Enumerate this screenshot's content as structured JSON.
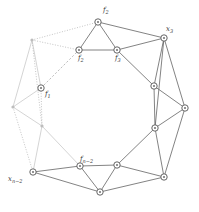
{
  "figure": {
    "width": 199,
    "height": 212,
    "background_color": "#ffffff",
    "edge_color": "#5a5a5a",
    "faint_edge_color": "#c2c2c2",
    "node_fill": "#ffffff",
    "node_stroke": "#555555"
  },
  "labels": [
    {
      "id": "label-f2",
      "text": "f",
      "sub": "2",
      "x": 103,
      "y": 7,
      "faint": false
    },
    {
      "id": "label-x3",
      "text": "x",
      "sub": "3",
      "x": 166,
      "y": 26,
      "faint": false
    },
    {
      "id": "label-f2b",
      "text": "f",
      "sub": "2",
      "x": 78,
      "y": 55,
      "faint": false
    },
    {
      "id": "label-f3",
      "text": "f",
      "sub": "3",
      "x": 115,
      "y": 55,
      "faint": false
    },
    {
      "id": "label-f1",
      "text": "f",
      "sub": "1",
      "x": 45,
      "y": 91,
      "faint": false
    },
    {
      "id": "label-fn2",
      "text": "f",
      "sub": "n−2",
      "x": 80,
      "y": 156,
      "faint": false
    },
    {
      "id": "label-xn2",
      "text": "x",
      "sub": "n−2",
      "x": 8,
      "y": 176,
      "faint": false
    }
  ],
  "nodes": [
    {
      "id": "n-top",
      "name": "vertex-f2-top",
      "x": 98,
      "y": 22,
      "style": "circle",
      "faint": false
    },
    {
      "id": "n-topright",
      "name": "vertex-x3",
      "x": 164,
      "y": 38,
      "style": "circle",
      "faint": false
    },
    {
      "id": "n-f2",
      "name": "vertex-f2",
      "x": 79,
      "y": 50,
      "style": "circle",
      "faint": false
    },
    {
      "id": "n-f3",
      "name": "vertex-f3",
      "x": 117,
      "y": 50,
      "style": "circle",
      "faint": false
    },
    {
      "id": "n-upleft",
      "name": "vertex-upper-left",
      "x": 32,
      "y": 40,
      "style": "dot",
      "faint": true
    },
    {
      "id": "n-f1",
      "name": "vertex-f1",
      "x": 41,
      "y": 88,
      "style": "circle",
      "faint": false
    },
    {
      "id": "n-left",
      "name": "vertex-left",
      "x": 13,
      "y": 107,
      "style": "dot",
      "faint": true
    },
    {
      "id": "n-lowleft",
      "name": "vertex-lower-left",
      "x": 42,
      "y": 126,
      "style": "dot",
      "faint": true
    },
    {
      "id": "n-xn2",
      "name": "vertex-xn-2",
      "x": 33,
      "y": 172,
      "style": "circle",
      "faint": false
    },
    {
      "id": "n-fn2",
      "name": "vertex-fn-2",
      "x": 80,
      "y": 166,
      "style": "circle",
      "faint": false
    },
    {
      "id": "n-bottom",
      "name": "vertex-bottom",
      "x": 100,
      "y": 192,
      "style": "circle",
      "faint": false
    },
    {
      "id": "n-botmid",
      "name": "vertex-bottom-mid",
      "x": 117,
      "y": 165,
      "style": "circle",
      "faint": false
    },
    {
      "id": "n-botright",
      "name": "vertex-bottom-right",
      "x": 164,
      "y": 177,
      "style": "circle",
      "faint": false
    },
    {
      "id": "n-rlow",
      "name": "vertex-right-lower",
      "x": 155,
      "y": 128,
      "style": "circle",
      "faint": false
    },
    {
      "id": "n-right",
      "name": "vertex-right",
      "x": 185,
      "y": 108,
      "style": "circle",
      "faint": false
    },
    {
      "id": "n-rup",
      "name": "vertex-right-upper",
      "x": 154,
      "y": 86,
      "style": "circle",
      "faint": false
    }
  ],
  "edges": [
    {
      "from": "n-top",
      "to": "n-f2",
      "style": "solid"
    },
    {
      "from": "n-top",
      "to": "n-f3",
      "style": "solid"
    },
    {
      "from": "n-top",
      "to": "n-topright",
      "style": "solid"
    },
    {
      "from": "n-f2",
      "to": "n-f3",
      "style": "solid"
    },
    {
      "from": "n-f3",
      "to": "n-topright",
      "style": "solid"
    },
    {
      "from": "n-f3",
      "to": "n-rup",
      "style": "solid"
    },
    {
      "from": "n-topright",
      "to": "n-rup",
      "style": "solid"
    },
    {
      "from": "n-topright",
      "to": "n-right",
      "style": "solid"
    },
    {
      "from": "n-topright",
      "to": "n-rlow",
      "style": "solid"
    },
    {
      "from": "n-rup",
      "to": "n-right",
      "style": "solid"
    },
    {
      "from": "n-rup",
      "to": "n-rlow",
      "style": "solid"
    },
    {
      "from": "n-right",
      "to": "n-rlow",
      "style": "solid"
    },
    {
      "from": "n-right",
      "to": "n-botright",
      "style": "solid"
    },
    {
      "from": "n-rlow",
      "to": "n-botmid",
      "style": "solid"
    },
    {
      "from": "n-rlow",
      "to": "n-botright",
      "style": "solid"
    },
    {
      "from": "n-botmid",
      "to": "n-botright",
      "style": "solid"
    },
    {
      "from": "n-botmid",
      "to": "n-bottom",
      "style": "solid"
    },
    {
      "from": "n-botmid",
      "to": "n-fn2",
      "style": "solid"
    },
    {
      "from": "n-botright",
      "to": "n-bottom",
      "style": "solid"
    },
    {
      "from": "n-bottom",
      "to": "n-fn2",
      "style": "solid"
    },
    {
      "from": "n-bottom",
      "to": "n-xn2",
      "style": "solid"
    },
    {
      "from": "n-fn2",
      "to": "n-xn2",
      "style": "solid"
    },
    {
      "from": "n-top",
      "to": "n-upleft",
      "style": "dotted"
    },
    {
      "from": "n-upleft",
      "to": "n-f2",
      "style": "dotted"
    },
    {
      "from": "n-upleft",
      "to": "n-f1",
      "style": "faint"
    },
    {
      "from": "n-upleft",
      "to": "n-left",
      "style": "faint"
    },
    {
      "from": "n-upleft",
      "to": "n-lowleft",
      "style": "dotted"
    },
    {
      "from": "n-f1",
      "to": "n-f2",
      "style": "dashed"
    },
    {
      "from": "n-f1",
      "to": "n-left",
      "style": "faint"
    },
    {
      "from": "n-f1",
      "to": "n-lowleft",
      "style": "dotted"
    },
    {
      "from": "n-left",
      "to": "n-lowleft",
      "style": "faint"
    },
    {
      "from": "n-left",
      "to": "n-xn2",
      "style": "dotted"
    },
    {
      "from": "n-lowleft",
      "to": "n-xn2",
      "style": "faint"
    },
    {
      "from": "n-lowleft",
      "to": "n-fn2",
      "style": "faint"
    }
  ]
}
